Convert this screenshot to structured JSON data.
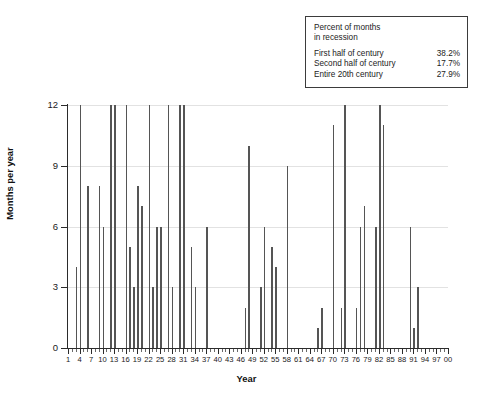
{
  "chart_data": {
    "type": "bar",
    "title": "",
    "xlabel": "Year",
    "ylabel": "Months per year",
    "ylim": [
      0,
      12
    ],
    "yticks": [
      0,
      3,
      6,
      9,
      12
    ],
    "xlim": [
      1,
      100
    ],
    "xtick_labels": [
      "1",
      "4",
      "7",
      "10",
      "13",
      "16",
      "19",
      "22",
      "25",
      "28",
      "31",
      "34",
      "37",
      "40",
      "43",
      "46",
      "49",
      "52",
      "55",
      "58",
      "61",
      "64",
      "67",
      "70",
      "73",
      "76",
      "79",
      "82",
      "85",
      "88",
      "91",
      "94",
      "97",
      "00"
    ],
    "xtick_values": [
      1,
      4,
      7,
      10,
      13,
      16,
      19,
      22,
      25,
      28,
      31,
      34,
      37,
      40,
      43,
      46,
      49,
      52,
      55,
      58,
      61,
      64,
      67,
      70,
      73,
      76,
      79,
      82,
      85,
      88,
      91,
      94,
      97,
      100
    ],
    "grid": "horizontal",
    "legend_position": "top-right",
    "x": [
      1,
      2,
      3,
      4,
      5,
      6,
      7,
      8,
      9,
      10,
      11,
      12,
      13,
      14,
      15,
      16,
      17,
      18,
      19,
      20,
      21,
      22,
      23,
      24,
      25,
      26,
      27,
      28,
      29,
      30,
      31,
      32,
      33,
      34,
      35,
      36,
      37,
      38,
      39,
      40,
      41,
      42,
      43,
      44,
      45,
      46,
      47,
      48,
      49,
      50,
      51,
      52,
      53,
      54,
      55,
      56,
      57,
      58,
      59,
      60,
      61,
      62,
      63,
      64,
      65,
      66,
      67,
      68,
      69,
      70,
      71,
      72,
      73,
      74,
      75,
      76,
      77,
      78,
      79,
      80,
      81,
      82,
      83,
      84,
      85,
      86,
      87,
      88,
      89,
      90,
      91,
      92,
      93,
      94,
      95,
      96,
      97,
      98,
      99,
      100
    ],
    "values": [
      0,
      0,
      4,
      12,
      0,
      8,
      0,
      0,
      8,
      6,
      0,
      12,
      12,
      0,
      0,
      12,
      5,
      3,
      8,
      7,
      0,
      12,
      3,
      6,
      6,
      0,
      12,
      3,
      0,
      12,
      12,
      0,
      5,
      3,
      0,
      0,
      6,
      0,
      0,
      0,
      0,
      0,
      0,
      0,
      0,
      0,
      2,
      10,
      0,
      0,
      3,
      6,
      0,
      5,
      4,
      0,
      0,
      9,
      0,
      0,
      0,
      0,
      0,
      0,
      0,
      1,
      2,
      0,
      0,
      11,
      0,
      2,
      12,
      0,
      0,
      2,
      6,
      7,
      0,
      0,
      6,
      12,
      11,
      0,
      0,
      0,
      0,
      0,
      0,
      6,
      1,
      3,
      0,
      0,
      0,
      0,
      0,
      0,
      0,
      0
    ]
  },
  "legend": {
    "title": "Percent of months\nin recession",
    "rows": [
      {
        "label": "First half of century",
        "value": "38.2%"
      },
      {
        "label": "Second half of century",
        "value": "17.7%"
      },
      {
        "label": "Entire 20th century",
        "value": "27.9%"
      }
    ]
  },
  "colors": {
    "bar": "#555555",
    "axis": "#2b2b2b",
    "grid": "#e2e2e2",
    "legend_border": "#3b3b3b",
    "background": "#ffffff"
  }
}
